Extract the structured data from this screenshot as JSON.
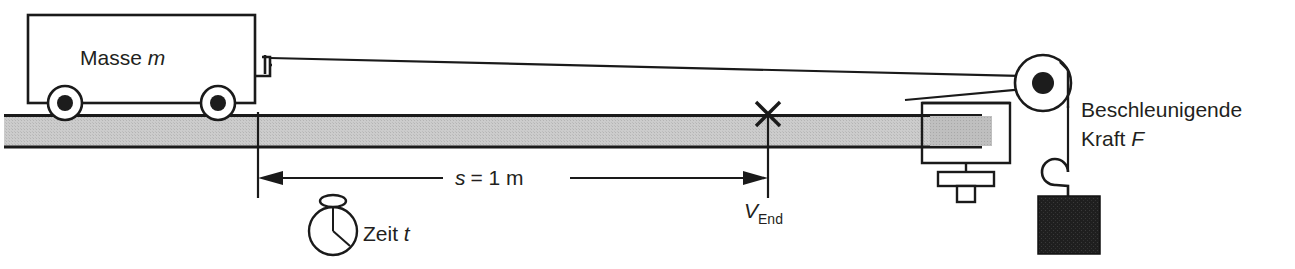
{
  "figure": {
    "labels": {
      "mass_prefix": "Masse ",
      "mass_symbol": "m",
      "distance_text": "s = 1 m",
      "distance_symbol": "s",
      "distance_value": "= 1 m",
      "time_prefix": "Zeit ",
      "time_symbol": "t",
      "velocity_symbol": "V",
      "velocity_subscript": "End",
      "force_line1": "Beschleunigende",
      "force_line2_prefix": "Kraft ",
      "force_line2_symbol": "F"
    },
    "icons": {
      "stopwatch": "stopwatch-icon",
      "cross_marker": "cross-marker-icon",
      "pulley": "pulley-icon",
      "weight": "weight-block-icon",
      "hook": "hook-icon",
      "wheel": "wheel-icon"
    },
    "colors": {
      "ink": "#1a1a1a",
      "text": "#231f20",
      "track_fill": "#c9c9c9",
      "device_fill": "#b8b8b8",
      "weight_fill": "#1c1c1c",
      "background": "#ffffff"
    },
    "geometry": {
      "distance_arrow_start_x": 258,
      "distance_arrow_end_x": 768,
      "distance_arrow_y": 178,
      "track_top_y": 114,
      "track_bottom_y": 148
    }
  }
}
